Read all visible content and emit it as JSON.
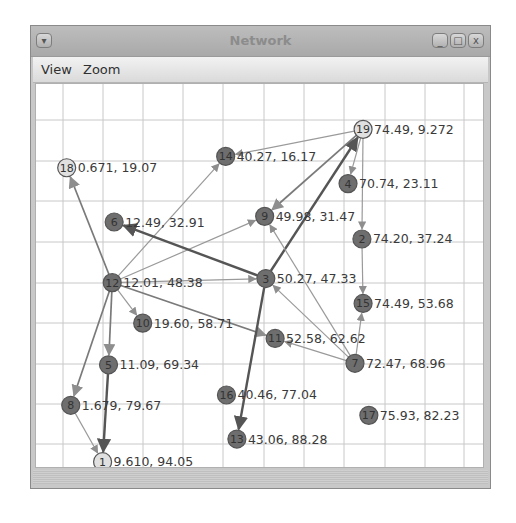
{
  "window": {
    "title": "Network",
    "menu_icon": "window-menu-icon",
    "controls": [
      {
        "name": "minimize-button",
        "icon": "minimize-icon",
        "glyph": "_"
      },
      {
        "name": "maximize-button",
        "icon": "maximize-icon",
        "glyph": "□"
      },
      {
        "name": "close-button",
        "icon": "close-icon",
        "glyph": "x"
      }
    ]
  },
  "menubar": {
    "items": [
      {
        "label": "View"
      },
      {
        "label": "Zoom"
      }
    ]
  },
  "graph": {
    "colors": {
      "node_dark": "#6e6e6e",
      "node_light": "#e0e0e0",
      "edge_light": "#9a9a9a",
      "edge_dark": "#555555",
      "grid": "#c8c8c8"
    },
    "nodes": [
      {
        "id": "1",
        "x": 9.61,
        "y": 94.05,
        "label": "9.610, 94.05",
        "fill": "light"
      },
      {
        "id": "2",
        "x": 74.2,
        "y": 37.24,
        "label": "74.20, 37.24",
        "fill": "dark"
      },
      {
        "id": "3",
        "x": 50.27,
        "y": 47.33,
        "label": "50.27, 47.33",
        "fill": "dark"
      },
      {
        "id": "4",
        "x": 70.74,
        "y": 23.11,
        "label": "70.74, 23.11",
        "fill": "dark"
      },
      {
        "id": "5",
        "x": 11.09,
        "y": 69.34,
        "label": "11.09, 69.34",
        "fill": "dark"
      },
      {
        "id": "6",
        "x": 12.49,
        "y": 32.91,
        "label": "12.49, 32.91",
        "fill": "dark"
      },
      {
        "id": "7",
        "x": 72.47,
        "y": 68.96,
        "label": "72.47, 68.96",
        "fill": "dark"
      },
      {
        "id": "8",
        "x": 1.679,
        "y": 79.67,
        "label": "1.679, 79.67",
        "fill": "dark"
      },
      {
        "id": "9",
        "x": 49.98,
        "y": 31.47,
        "label": "49.98, 31.47",
        "fill": "dark"
      },
      {
        "id": "10",
        "x": 19.6,
        "y": 58.71,
        "label": "19.60, 58.71",
        "fill": "dark"
      },
      {
        "id": "11",
        "x": 52.58,
        "y": 62.62,
        "label": "52.58, 62.62",
        "fill": "dark"
      },
      {
        "id": "12",
        "x": 12.01,
        "y": 48.38,
        "label": "12.01, 48.38",
        "fill": "dark"
      },
      {
        "id": "13",
        "x": 43.06,
        "y": 88.28,
        "label": "43.06, 88.28",
        "fill": "dark"
      },
      {
        "id": "14",
        "x": 40.27,
        "y": 16.17,
        "label": "40.27, 16.17",
        "fill": "dark"
      },
      {
        "id": "15",
        "x": 74.49,
        "y": 53.68,
        "label": "74.49, 53.68",
        "fill": "dark"
      },
      {
        "id": "16",
        "x": 40.46,
        "y": 77.04,
        "label": "40.46, 77.04",
        "fill": "dark"
      },
      {
        "id": "17",
        "x": 75.93,
        "y": 82.23,
        "label": "75.93, 82.23",
        "fill": "dark"
      },
      {
        "id": "18",
        "x": 0.671,
        "y": 19.07,
        "label": "0.671, 19.07",
        "fill": "light"
      },
      {
        "id": "19",
        "x": 74.49,
        "y": 9.272,
        "label": "74.49, 9.272",
        "fill": "light"
      }
    ],
    "edges": [
      {
        "from": "12",
        "to": "18",
        "weight": "medium"
      },
      {
        "from": "12",
        "to": "14",
        "weight": "light"
      },
      {
        "from": "12",
        "to": "9",
        "weight": "light"
      },
      {
        "from": "12",
        "to": "3",
        "weight": "light"
      },
      {
        "from": "12",
        "to": "10",
        "weight": "light"
      },
      {
        "from": "12",
        "to": "11",
        "weight": "medium"
      },
      {
        "from": "12",
        "to": "8",
        "weight": "medium"
      },
      {
        "from": "12",
        "to": "5",
        "weight": "medium"
      },
      {
        "from": "5",
        "to": "1",
        "weight": "heavy"
      },
      {
        "from": "8",
        "to": "1",
        "weight": "light"
      },
      {
        "from": "3",
        "to": "6",
        "weight": "heavy"
      },
      {
        "from": "3",
        "to": "19",
        "weight": "heavy"
      },
      {
        "from": "3",
        "to": "13",
        "weight": "heavy"
      },
      {
        "from": "19",
        "to": "14",
        "weight": "light"
      },
      {
        "from": "19",
        "to": "9",
        "weight": "medium"
      },
      {
        "from": "19",
        "to": "4",
        "weight": "light"
      },
      {
        "from": "19",
        "to": "2",
        "weight": "light"
      },
      {
        "from": "2",
        "to": "15",
        "weight": "light"
      },
      {
        "from": "7",
        "to": "15",
        "weight": "light"
      },
      {
        "from": "7",
        "to": "3",
        "weight": "light"
      },
      {
        "from": "7",
        "to": "9",
        "weight": "light"
      },
      {
        "from": "7",
        "to": "11",
        "weight": "light"
      }
    ]
  }
}
